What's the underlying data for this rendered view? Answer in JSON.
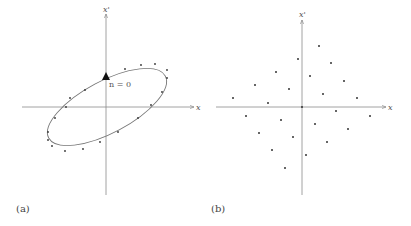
{
  "panels": [
    {
      "caption": "(a)",
      "x_axis_label": "x",
      "y_axis_label": "x'",
      "annotation": "n = 0",
      "origin": [
        106,
        107
      ],
      "ellipse": {
        "cx": 107,
        "cy": 107,
        "rx": 66,
        "ry": 26,
        "rotate": -28
      },
      "points": [
        [
          141,
          65
        ],
        [
          155,
          64
        ],
        [
          167,
          70
        ],
        [
          167,
          78
        ],
        [
          125,
          69
        ],
        [
          105,
          78
        ],
        [
          85,
          90
        ],
        [
          70,
          98
        ],
        [
          66,
          107
        ],
        [
          55,
          118
        ],
        [
          48,
          132
        ],
        [
          48,
          140
        ],
        [
          52,
          146
        ],
        [
          65,
          151
        ],
        [
          83,
          149
        ],
        [
          100,
          142
        ],
        [
          118,
          132
        ],
        [
          138,
          118
        ],
        [
          151,
          105
        ],
        [
          162,
          92
        ]
      ]
    },
    {
      "caption": "(b)",
      "x_axis_label": "x",
      "y_axis_label": "x'",
      "origin": [
        302,
        107
      ],
      "points": [
        [
          319,
          46
        ],
        [
          298,
          59
        ],
        [
          331,
          63
        ],
        [
          276,
          72
        ],
        [
          310,
          76
        ],
        [
          255,
          85
        ],
        [
          344,
          81
        ],
        [
          289,
          89
        ],
        [
          323,
          94
        ],
        [
          233,
          98
        ],
        [
          268,
          103
        ],
        [
          357,
          98
        ],
        [
          302,
          107
        ],
        [
          336,
          111
        ],
        [
          246,
          116
        ],
        [
          370,
          116
        ],
        [
          281,
          120
        ],
        [
          315,
          124
        ],
        [
          348,
          129
        ],
        [
          259,
          133
        ],
        [
          293,
          137
        ],
        [
          327,
          142
        ],
        [
          272,
          150
        ],
        [
          306,
          155
        ],
        [
          285,
          168
        ]
      ]
    }
  ]
}
